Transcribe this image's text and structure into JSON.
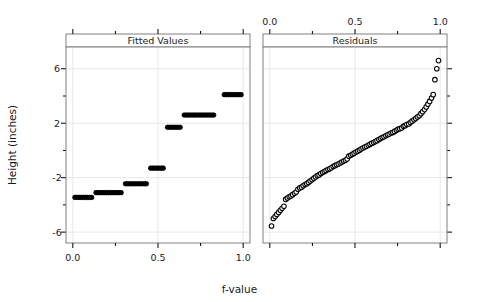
{
  "figure": {
    "ylabel": "Height (inches)",
    "xlabel": "f-value",
    "background": "#ffffff",
    "foreground": "#000000",
    "grid_color": "#e8e8e8",
    "frame_color": "#808080"
  },
  "panels": [
    {
      "id": "fitted",
      "strip_label": "Fitted Values"
    },
    {
      "id": "residuals",
      "strip_label": "Residuals"
    }
  ],
  "axes": {
    "x_ticks_major": [
      "0.0",
      "0.5",
      "1.0"
    ],
    "x_tick_values": [
      0.0,
      0.5,
      1.0
    ],
    "x_minor_values": [
      0.25,
      0.75
    ],
    "y_ticks_major": [
      "6",
      "2",
      "-2",
      "-6"
    ],
    "y_tick_values": [
      6,
      2,
      -2,
      -6
    ],
    "y_minor_values": [
      4,
      0,
      -4
    ],
    "xlim": [
      -0.04,
      1.04
    ],
    "ylim": [
      -6.8,
      7.6
    ],
    "bottom_axis_panel": "fitted",
    "top_axis_panel": "residuals"
  },
  "chart_data": {
    "type": "scatter",
    "title": "",
    "subtitle": "",
    "xlabel": "f-value",
    "ylabel": "Height (inches)",
    "xlim": [
      -0.04,
      1.04
    ],
    "ylim": [
      -6.8,
      7.6
    ],
    "grid": true,
    "legend": "none",
    "panel_layout": "1 row x 2 columns",
    "series": [
      {
        "name": "Fitted Values",
        "panel": "fitted",
        "marker": "filled-circle",
        "marker_size": 4.6,
        "color": "#000000",
        "description": "Quantile plot of centered fitted values - a step function with 7 discrete levels (one per group).",
        "x": [
          0.012,
          0.025,
          0.037,
          0.049,
          0.062,
          0.074,
          0.086,
          0.099,
          0.111,
          0.136,
          0.148,
          0.16,
          0.173,
          0.185,
          0.198,
          0.21,
          0.222,
          0.235,
          0.247,
          0.259,
          0.272,
          0.284,
          0.309,
          0.321,
          0.333,
          0.346,
          0.358,
          0.37,
          0.383,
          0.395,
          0.407,
          0.42,
          0.432,
          0.457,
          0.469,
          0.481,
          0.494,
          0.506,
          0.519,
          0.531,
          0.556,
          0.568,
          0.58,
          0.593,
          0.605,
          0.617,
          0.63,
          0.654,
          0.667,
          0.679,
          0.691,
          0.704,
          0.716,
          0.728,
          0.741,
          0.753,
          0.765,
          0.778,
          0.79,
          0.802,
          0.815,
          0.827,
          0.889,
          0.901,
          0.914,
          0.926,
          0.938,
          0.951,
          0.963,
          0.975,
          0.988
        ],
        "y": [
          -3.45,
          -3.45,
          -3.45,
          -3.45,
          -3.45,
          -3.45,
          -3.45,
          -3.45,
          -3.45,
          -3.1,
          -3.1,
          -3.1,
          -3.1,
          -3.1,
          -3.1,
          -3.1,
          -3.1,
          -3.1,
          -3.1,
          -3.1,
          -3.1,
          -3.1,
          -2.45,
          -2.45,
          -2.45,
          -2.45,
          -2.45,
          -2.45,
          -2.45,
          -2.45,
          -2.45,
          -2.45,
          -2.45,
          -1.3,
          -1.3,
          -1.3,
          -1.3,
          -1.3,
          -1.3,
          -1.3,
          1.7,
          1.7,
          1.7,
          1.7,
          1.7,
          1.7,
          1.7,
          2.6,
          2.6,
          2.6,
          2.6,
          2.6,
          2.6,
          2.6,
          2.6,
          2.6,
          2.6,
          2.6,
          2.6,
          2.6,
          2.6,
          2.6,
          4.1,
          4.1,
          4.1,
          4.1,
          4.1,
          4.1,
          4.1,
          4.1,
          4.1
        ],
        "step_levels": [
          -3.45,
          -3.1,
          -2.45,
          -1.3,
          1.7,
          2.6,
          3.45,
          4.1
        ],
        "step_level_values": [
          -3.45,
          -3.1,
          -2.45,
          -1.3,
          1.7,
          2.6,
          3.45,
          4.1
        ],
        "steps": [
          {
            "x_start": 0.005,
            "x_end": 0.118,
            "y": -3.45
          },
          {
            "x_start": 0.13,
            "x_end": 0.292,
            "y": -3.1
          },
          {
            "x_start": 0.302,
            "x_end": 0.44,
            "y": -2.45
          },
          {
            "x_start": 0.45,
            "x_end": 0.54,
            "y": -1.3
          },
          {
            "x_start": 0.549,
            "x_end": 0.638,
            "y": 1.7
          },
          {
            "x_start": 0.648,
            "x_end": 0.73,
            "y": 2.6
          },
          {
            "x_start": 0.722,
            "x_end": 0.835,
            "y": 3.45
          },
          {
            "x_start": 0.882,
            "x_end": 0.995,
            "y": 4.1
          }
        ]
      },
      {
        "name": "Residuals",
        "panel": "residuals",
        "marker": "open-circle",
        "marker_size": 4.6,
        "color": "#000000",
        "description": "Quantile plot of residuals - smoothly increasing, with three large positive outliers at the top right.",
        "x": [
          0.01,
          0.021,
          0.031,
          0.041,
          0.052,
          0.062,
          0.072,
          0.083,
          0.093,
          0.103,
          0.114,
          0.124,
          0.134,
          0.145,
          0.155,
          0.165,
          0.176,
          0.186,
          0.196,
          0.207,
          0.217,
          0.227,
          0.237,
          0.248,
          0.258,
          0.268,
          0.279,
          0.289,
          0.299,
          0.31,
          0.32,
          0.33,
          0.341,
          0.351,
          0.361,
          0.372,
          0.382,
          0.392,
          0.402,
          0.413,
          0.423,
          0.433,
          0.444,
          0.454,
          0.464,
          0.475,
          0.485,
          0.495,
          0.506,
          0.516,
          0.526,
          0.536,
          0.547,
          0.557,
          0.567,
          0.578,
          0.588,
          0.598,
          0.609,
          0.619,
          0.629,
          0.64,
          0.65,
          0.66,
          0.67,
          0.681,
          0.691,
          0.701,
          0.712,
          0.722,
          0.732,
          0.743,
          0.753,
          0.763,
          0.774,
          0.784,
          0.794,
          0.804,
          0.815,
          0.825,
          0.835,
          0.846,
          0.856,
          0.866,
          0.877,
          0.887,
          0.897,
          0.908,
          0.918,
          0.928,
          0.938,
          0.949,
          0.959,
          0.969,
          0.98,
          0.99
        ],
        "y": [
          -5.55,
          -5.0,
          -4.85,
          -4.7,
          -4.55,
          -4.4,
          -4.25,
          -4.1,
          -3.6,
          -3.5,
          -3.4,
          -3.35,
          -3.25,
          -3.15,
          -3.05,
          -2.85,
          -2.75,
          -2.7,
          -2.6,
          -2.5,
          -2.45,
          -2.35,
          -2.25,
          -2.15,
          -2.05,
          -1.95,
          -1.85,
          -1.8,
          -1.7,
          -1.62,
          -1.55,
          -1.48,
          -1.4,
          -1.35,
          -1.28,
          -1.18,
          -1.12,
          -1.05,
          -1.0,
          -0.92,
          -0.85,
          -0.78,
          -0.72,
          -0.62,
          -0.42,
          -0.35,
          -0.28,
          -0.2,
          -0.12,
          -0.05,
          0.02,
          0.1,
          0.18,
          0.25,
          0.3,
          0.38,
          0.45,
          0.52,
          0.58,
          0.65,
          0.72,
          0.8,
          0.88,
          0.95,
          1.0,
          1.08,
          1.15,
          1.2,
          1.28,
          1.32,
          1.4,
          1.48,
          1.55,
          1.6,
          1.65,
          1.78,
          1.82,
          1.9,
          1.95,
          2.05,
          2.15,
          2.25,
          2.35,
          2.45,
          2.55,
          2.7,
          2.85,
          3.0,
          3.2,
          3.4,
          3.6,
          3.85,
          4.1,
          5.2,
          6.0,
          6.6
        ],
        "outliers": [
          {
            "x": 0.969,
            "y": 5.2
          },
          {
            "x": 0.98,
            "y": 6.0
          },
          {
            "x": 0.99,
            "y": 6.6
          }
        ]
      }
    ]
  }
}
